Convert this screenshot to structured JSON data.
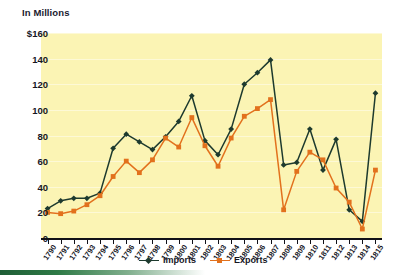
{
  "chart_data": {
    "type": "line",
    "title": "In Millions",
    "xlabel": "",
    "ylabel": "In Millions",
    "ylim": [
      0,
      160
    ],
    "yticks": [
      "0",
      "20",
      "40",
      "60",
      "80",
      "100",
      "120",
      "140",
      "$160"
    ],
    "ytick_values": [
      0,
      20,
      40,
      60,
      80,
      100,
      120,
      140,
      160
    ],
    "grid": true,
    "legend_position": "bottom-center",
    "categories": [
      "1790",
      "1791",
      "1792",
      "1793",
      "1794",
      "1795",
      "1796",
      "1797",
      "1798",
      "1799",
      "1800",
      "1801",
      "1802",
      "1803",
      "1804",
      "1805",
      "1806",
      "1807",
      "1808",
      "1809",
      "1810",
      "1811",
      "1812",
      "1813",
      "1814",
      "1815"
    ],
    "series": [
      {
        "name": "Imports",
        "color": "#1d3a2e",
        "marker": "diamond",
        "values": [
          23,
          29,
          31,
          31,
          35,
          70,
          81,
          75,
          69,
          79,
          91,
          111,
          76,
          65,
          85,
          120,
          129,
          139,
          57,
          59,
          85,
          53,
          77,
          22,
          13,
          113
        ]
      },
      {
        "name": "Exports",
        "color": "#e2711d",
        "marker": "square",
        "values": [
          20,
          19,
          21,
          26,
          33,
          48,
          60,
          51,
          61,
          78,
          71,
          94,
          72,
          56,
          78,
          95,
          101,
          108,
          22,
          52,
          67,
          61,
          39,
          28,
          7,
          53
        ]
      }
    ]
  },
  "legend": {
    "entries": [
      {
        "label": "Imports"
      },
      {
        "label": "Exports"
      }
    ]
  },
  "colors": {
    "plot_background": "#fbf4b4",
    "imports": "#1d3a2e",
    "exports": "#e2711d",
    "axis": "#111118",
    "text": "#16161f",
    "accent_bar": "#1f5e36"
  }
}
